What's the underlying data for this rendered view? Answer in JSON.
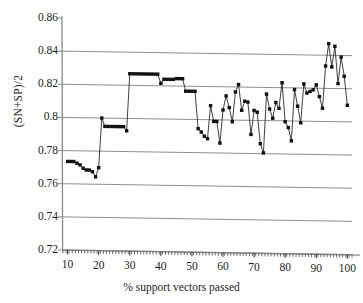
{
  "figure": {
    "background": "#ffffff",
    "ink": "#141414",
    "grid_color": "#8f8f8f",
    "axis_color": "#8a8a8a",
    "marker_color": "#101010",
    "line_color": "#2a2a2a"
  },
  "chart_data": {
    "type": "line",
    "title": "",
    "subtitle": "",
    "xlabel": "% support vectors passed",
    "ylabel": "(SN+SP)/2",
    "xlim": [
      8.2,
      101.5
    ],
    "ylim": [
      0.72,
      0.86
    ],
    "xticks": [
      10,
      20,
      30,
      40,
      50,
      60,
      70,
      80,
      90,
      100
    ],
    "xticklabels": [
      "10",
      "20",
      "30",
      "40",
      "50",
      "60",
      "70",
      "80",
      "90",
      "100"
    ],
    "yticks": [
      0.72,
      0.74,
      0.76,
      0.78,
      0.8,
      0.82,
      0.84,
      0.86
    ],
    "yticklabels": [
      "0.72",
      "0.74",
      "0.76",
      "0.78",
      "0.8",
      "0.82",
      "0.84",
      "0.86"
    ],
    "grid": "horizontal",
    "legend": null,
    "marker": "square",
    "series": [
      {
        "name": "(SN+SP)/2",
        "x": [
          10,
          11,
          12,
          13,
          14,
          15,
          16,
          17,
          18,
          19,
          20,
          21,
          22,
          23,
          24,
          25,
          26,
          27,
          28,
          29,
          30,
          31,
          32,
          33,
          34,
          35,
          36,
          37,
          38,
          39,
          40,
          41,
          42,
          43,
          44,
          45,
          46,
          47,
          48,
          49,
          50,
          51,
          52,
          53,
          54,
          55,
          56,
          57,
          58,
          59,
          60,
          61,
          62,
          63,
          64,
          65,
          66,
          67,
          68,
          69,
          70,
          71,
          72,
          73,
          74,
          75,
          76,
          77,
          78,
          79,
          80,
          81,
          82,
          83,
          84,
          85,
          86,
          87,
          88,
          89,
          90,
          91,
          92,
          93,
          94,
          95,
          96,
          97,
          98,
          99,
          100
        ],
        "y": [
          0.7735,
          0.7735,
          0.7735,
          0.7725,
          0.7715,
          0.7695,
          0.7685,
          0.7685,
          0.7675,
          0.7645,
          0.77,
          0.8,
          0.795,
          0.795,
          0.795,
          0.795,
          0.795,
          0.795,
          0.795,
          0.7925,
          0.827,
          0.827,
          0.827,
          0.827,
          0.827,
          0.827,
          0.827,
          0.827,
          0.827,
          0.827,
          0.8215,
          0.824,
          0.824,
          0.824,
          0.824,
          0.8245,
          0.8245,
          0.8245,
          0.817,
          0.817,
          0.817,
          0.817,
          0.7945,
          0.7925,
          0.79,
          0.7885,
          0.8085,
          0.799,
          0.799,
          0.786,
          0.806,
          0.8145,
          0.8075,
          0.799,
          0.817,
          0.8215,
          0.806,
          0.8115,
          0.811,
          0.7915,
          0.806,
          0.805,
          0.786,
          0.7805,
          0.816,
          0.807,
          0.8015,
          0.811,
          0.8075,
          0.823,
          0.7995,
          0.796,
          0.788,
          0.819,
          0.809,
          0.799,
          0.8225,
          0.817,
          0.818,
          0.819,
          0.822,
          0.815,
          0.808,
          0.8335,
          0.847,
          0.833,
          0.8455,
          0.823,
          0.839,
          0.8275,
          0.81
        ]
      }
    ]
  }
}
